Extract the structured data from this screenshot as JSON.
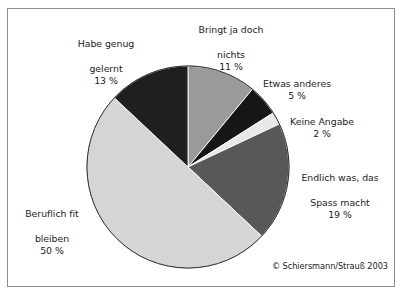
{
  "figure": {
    "copyright": "© Schiersmann/Strauß 2003",
    "frame_border_color": "#8c8c8c",
    "background_color": "#ffffff"
  },
  "chart_data": {
    "type": "pie",
    "title": "",
    "subtitle": "",
    "xlabel": "",
    "ylabel": "",
    "units": "%",
    "legend_position": "none",
    "labels_position": "outside-callout",
    "grid": false,
    "total": 100,
    "start_angle_deg": 0,
    "direction": "clockwise",
    "categories": [
      "Bringt ja doch nichts",
      "Etwas anderes",
      "Keine Angabe",
      "Endlich was, das Spass macht",
      "Beruflich fit bleiben",
      "Habe genug gelernt"
    ],
    "values": [
      11,
      5,
      2,
      19,
      50,
      13
    ],
    "colors": [
      "#9a9a9a",
      "#161616",
      "#e8e8e8",
      "#585858",
      "#d5d5d5",
      "#1f1f1f"
    ],
    "slices": [
      {
        "name": "bringt-ja-doch-nichts",
        "label_line1": "Bringt ja doch",
        "label_line2": "nichts",
        "value": 11,
        "value_text": "11 %",
        "color": "#9a9a9a"
      },
      {
        "name": "etwas-anderes",
        "label_line1": "Etwas anderes",
        "label_line2": "",
        "value": 5,
        "value_text": "5 %",
        "color": "#161616"
      },
      {
        "name": "keine-angabe",
        "label_line1": "Keine Angabe",
        "label_line2": "",
        "value": 2,
        "value_text": "2 %",
        "color": "#e8e8e8"
      },
      {
        "name": "endlich-was-das-spass-macht",
        "label_line1": "Endlich was, das",
        "label_line2": "Spass macht",
        "value": 19,
        "value_text": "19 %",
        "color": "#585858"
      },
      {
        "name": "beruflich-fit-bleiben",
        "label_line1": "Beruflich fit",
        "label_line2": "bleiben",
        "value": 50,
        "value_text": "50 %",
        "color": "#d5d5d5"
      },
      {
        "name": "habe-genug-gelernt",
        "label_line1": "Habe genug",
        "label_line2": "gelernt",
        "value": 13,
        "value_text": "13 %",
        "color": "#1f1f1f"
      }
    ],
    "geometry": {
      "center_x": 188,
      "center_y": 167,
      "radius": 101
    }
  }
}
